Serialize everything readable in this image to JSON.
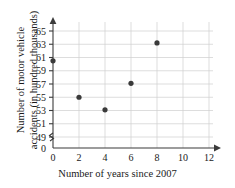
{
  "chart_data": {
    "type": "scatter",
    "title": "",
    "xlabel": "Number of years since 2007",
    "ylabel": "Number of motor vehicle accidents (in hundred thousands)",
    "ylabel_lines": [
      "Number of motor vehicle",
      "accidents (in hundred  thousands)"
    ],
    "x": [
      0,
      2,
      4,
      6,
      8
    ],
    "values": [
      60.5,
      55,
      53.1,
      57.1,
      63.2
    ],
    "points": [
      {
        "x": 0,
        "y": 60.5
      },
      {
        "x": 2,
        "y": 55
      },
      {
        "x": 4,
        "y": 53.1
      },
      {
        "x": 6,
        "y": 57.1
      },
      {
        "x": 8,
        "y": 63.2
      }
    ],
    "xticks": [
      0,
      2,
      4,
      6,
      8,
      10,
      12
    ],
    "xtick_labels": [
      "0",
      "2",
      "4",
      "6",
      "8",
      "10",
      "12"
    ],
    "yticks": [
      49,
      51,
      53,
      55,
      57,
      59,
      61,
      63,
      65
    ],
    "ytick_labels": [
      "49",
      "51",
      "53",
      "55",
      "57",
      "59",
      "61",
      "63",
      "65"
    ],
    "y_origin_label": "0",
    "xlim": [
      0,
      12
    ],
    "ylim": [
      49,
      65
    ],
    "grid": true,
    "axis_break": true,
    "legend": "none",
    "colors": {
      "point": "#3a3a3a",
      "axis": "#3b3b3b",
      "grid": "#cfcfcf",
      "background": "#ffffff"
    }
  }
}
